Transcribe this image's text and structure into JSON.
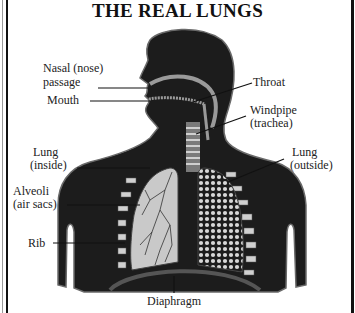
{
  "title": "THE REAL LUNGS",
  "labels": {
    "nasal_line1": "Nasal (nose)",
    "nasal_line2": "passage",
    "mouth": "Mouth",
    "throat": "Throat",
    "windpipe_line1": "Windpipe",
    "windpipe_line2": "(trachea)",
    "lung_outside_line1": "Lung",
    "lung_outside_line2": "(outside)",
    "lung_inside_line1": "Lung",
    "lung_inside_line2": "(inside)",
    "alveoli_line1": "Alveoli",
    "alveoli_line2": "(air sacs)",
    "rib": "Rib",
    "diaphragm": "Diaphragm"
  },
  "colors": {
    "body": "#1c1c1c",
    "outline": "#6a6a6a",
    "airway": "#9a9a9a",
    "lung_inside": "#c9c9c9",
    "alveoli": "#d8d8d8",
    "text": "#222222"
  }
}
